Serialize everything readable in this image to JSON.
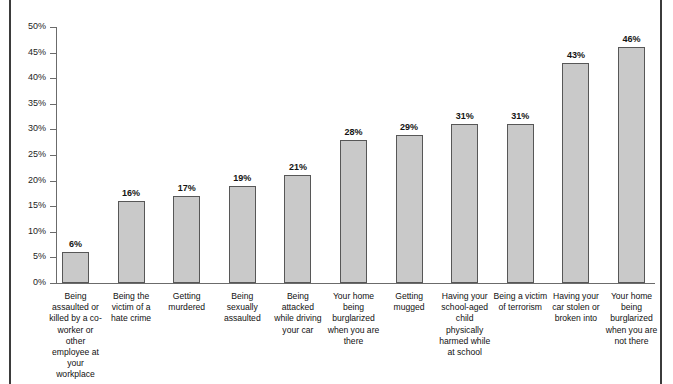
{
  "chart_data": {
    "type": "bar",
    "title": "",
    "subtitle": "",
    "xlabel": "",
    "ylabel": "",
    "ylim": [
      0,
      50
    ],
    "grid": false,
    "legend": "none",
    "y_tick_labels": [
      "50%",
      "45%",
      "40%",
      "35%",
      "30%",
      "25%",
      "20%",
      "15%",
      "10%",
      "5%",
      "0%"
    ],
    "y_tick_values": [
      50,
      45,
      40,
      35,
      30,
      25,
      20,
      15,
      10,
      5,
      0
    ],
    "categories": [
      "Being assaulted or killed by a co-worker or other employee at your workplace",
      "Being the victim of a hate crime",
      "Getting murdered",
      "Being sexually assaulted",
      "Being attacked while driving your car",
      "Your home being burglarized when you are there",
      "Getting mugged",
      "Having your school-aged child physically harmed while at school",
      "Being a victim of terrorism",
      "Having your car stolen or broken into",
      "Your home being burglarized when you are not there"
    ],
    "values": [
      6,
      16,
      17,
      19,
      21,
      28,
      29,
      31,
      31,
      43,
      46
    ],
    "data_labels": [
      "6%",
      "16%",
      "17%",
      "19%",
      "21%",
      "28%",
      "29%",
      "31%",
      "31%",
      "43%",
      "46%"
    ],
    "colors": {
      "bar_fill": "#c9c9c9",
      "bar_edge": "#575757",
      "axis": "#6b6b6b",
      "text": "#111111",
      "frame_rule": "#3b3b3b"
    }
  }
}
